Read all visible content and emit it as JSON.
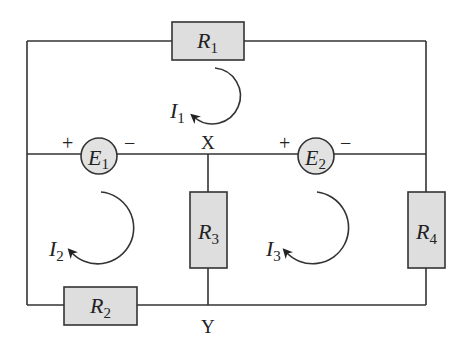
{
  "diagram": {
    "type": "circuit",
    "resistors": [
      {
        "id": "R1",
        "letter": "R",
        "sub": "1"
      },
      {
        "id": "R2",
        "letter": "R",
        "sub": "2"
      },
      {
        "id": "R3",
        "letter": "R",
        "sub": "3"
      },
      {
        "id": "R4",
        "letter": "R",
        "sub": "4"
      }
    ],
    "sources": [
      {
        "id": "E1",
        "letter": "E",
        "sub": "1",
        "plus": "+",
        "minus": "−"
      },
      {
        "id": "E2",
        "letter": "E",
        "sub": "2",
        "plus": "+",
        "minus": "−"
      }
    ],
    "loop_currents": [
      {
        "id": "I1",
        "letter": "I",
        "sub": "1",
        "direction": "clockwise"
      },
      {
        "id": "I2",
        "letter": "I",
        "sub": "2",
        "direction": "clockwise"
      },
      {
        "id": "I3",
        "letter": "I",
        "sub": "3",
        "direction": "clockwise"
      }
    ],
    "nodes": [
      {
        "id": "X",
        "label": "X"
      },
      {
        "id": "Y",
        "label": "Y"
      }
    ],
    "colors": {
      "wire": "#333333",
      "component_fill": "#dedede",
      "background": "#ffffff"
    }
  }
}
